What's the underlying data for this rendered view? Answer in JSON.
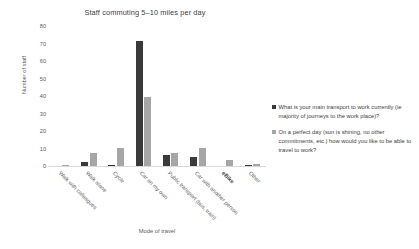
{
  "chart_data": {
    "type": "bar",
    "title": "Staff commuting 5–10 miles per day",
    "xlabel": "Mode of travel",
    "ylabel": "Number of staff",
    "ylim": [
      0,
      80
    ],
    "yticks": [
      80,
      70,
      60,
      50,
      40,
      30,
      20,
      10,
      0
    ],
    "grid": false,
    "legend_position": "right",
    "categories": [
      "Walk with colleagues",
      "Walk alone",
      "Cycle",
      "Car on my own",
      "Public transport (bus, train)",
      "Car with another person",
      "eBike",
      "Other"
    ],
    "series": [
      {
        "name": "What is your main transport to work currently (ie majority of journeys to the work place)?",
        "color": "#3a3a3a",
        "values": [
          0,
          3,
          1,
          72,
          7,
          6,
          0,
          1
        ]
      },
      {
        "name": "On a perfect day (sun is shining, no other commitments, etc.) how would you like to be able to travel to work?",
        "color": "#a6a6a6",
        "values": [
          1,
          8,
          11,
          40,
          8,
          11,
          4,
          2
        ]
      }
    ]
  },
  "legend": {
    "entries": [
      {
        "label": "What is your main transport to work currently (ie majority of journeys to the work place)?",
        "swatch": "series-0"
      },
      {
        "label": "On a perfect day (sun is shining, no other commitments, etc.) how would you like to be able to travel to work?",
        "swatch": "series-1"
      }
    ]
  }
}
